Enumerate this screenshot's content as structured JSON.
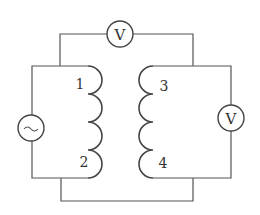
{
  "diagram": {
    "type": "transformer-circuit",
    "primary_coil": {
      "terminal_top": "1",
      "terminal_bottom": "2",
      "turns": 4
    },
    "secondary_coil": {
      "terminal_top": "3",
      "terminal_bottom": "4",
      "turns": 4
    },
    "source": {
      "symbol": "~",
      "name": "AC source"
    },
    "voltmeter_top": {
      "symbol": "V",
      "name": "Voltmeter between coils (top)"
    },
    "voltmeter_right": {
      "symbol": "V",
      "name": "Voltmeter on secondary"
    },
    "colors": {
      "line": "#555555",
      "background": "#ffffff"
    }
  }
}
